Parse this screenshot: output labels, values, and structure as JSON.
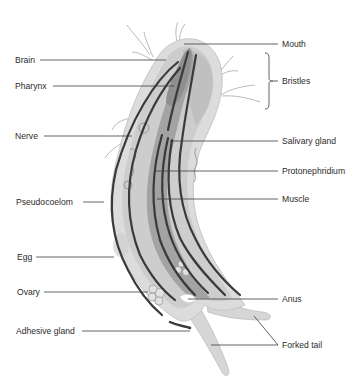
{
  "diagram": {
    "labels_left": [
      {
        "id": "brain",
        "text": "Brain",
        "x": 15,
        "y": 55
      },
      {
        "id": "pharynx",
        "text": "Pharynx",
        "x": 15,
        "y": 81
      },
      {
        "id": "nerve",
        "text": "Nerve",
        "x": 15,
        "y": 131
      },
      {
        "id": "pseudocoelom",
        "text": "Pseudocoelom",
        "x": 16,
        "y": 197
      },
      {
        "id": "egg",
        "text": "Egg",
        "x": 17,
        "y": 252
      },
      {
        "id": "ovary",
        "text": "Ovary",
        "x": 17,
        "y": 287
      },
      {
        "id": "adhesive-gland",
        "text": "Adhesive gland",
        "x": 16,
        "y": 326
      }
    ],
    "labels_right": [
      {
        "id": "mouth",
        "text": "Mouth",
        "x": 282,
        "y": 39
      },
      {
        "id": "bristles",
        "text": "Bristles",
        "x": 282,
        "y": 76
      },
      {
        "id": "salivary-gland",
        "text": "Salivary gland",
        "x": 282,
        "y": 136
      },
      {
        "id": "protonephridium",
        "text": "Protonephridium",
        "x": 282,
        "y": 166
      },
      {
        "id": "muscle",
        "text": "Muscle",
        "x": 282,
        "y": 194
      },
      {
        "id": "anus",
        "text": "Anus",
        "x": 282,
        "y": 294
      },
      {
        "id": "forked-tail",
        "text": "Forked tail",
        "x": 282,
        "y": 340
      }
    ],
    "colors": {
      "body_outer": "#d9d9d9",
      "body_inner": "#c4c4c4",
      "gut": "#9a9a9a",
      "muscle": "#3a3a3a",
      "leader": "#3c3c3c",
      "bristle": "#9e9e9e"
    }
  }
}
